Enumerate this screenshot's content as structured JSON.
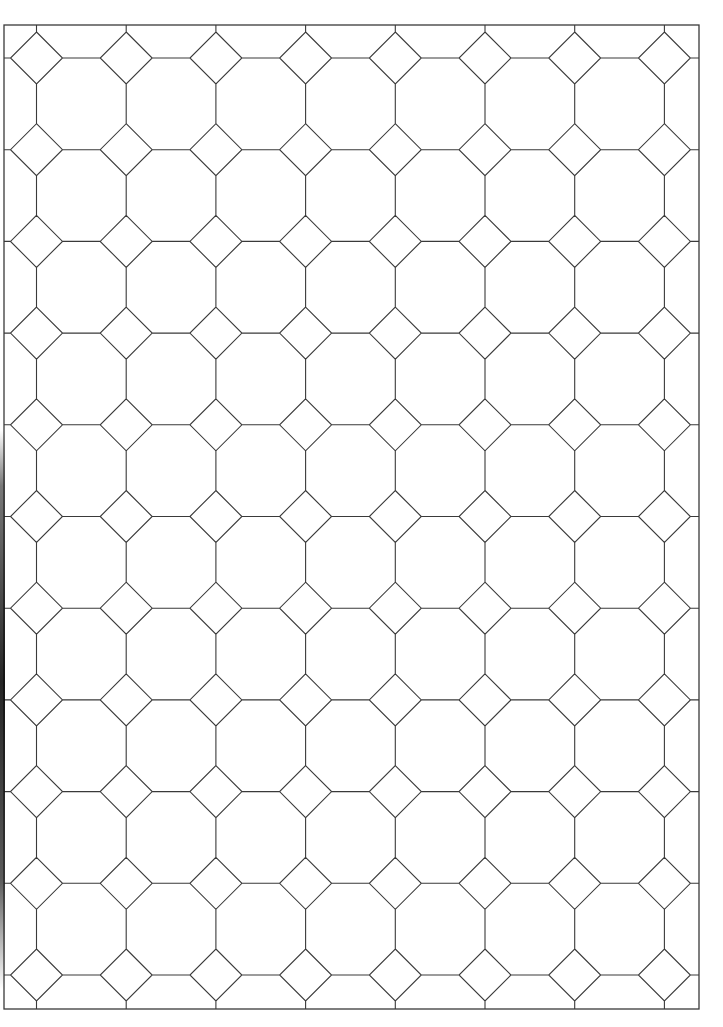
{
  "page": {
    "background_color": "#ffffff",
    "line_color": "#3a3a3a"
  },
  "tiling": {
    "type": "octagon-square",
    "columns": 8,
    "rows": 11,
    "border": {
      "left": 4,
      "top": 25,
      "right": 699,
      "bottom": 1009
    },
    "first_center": {
      "x": 36.5,
      "y": 58
    },
    "spacing": {
      "x": 89.7,
      "y": 91.7
    },
    "diamond_half_size": 26
  }
}
